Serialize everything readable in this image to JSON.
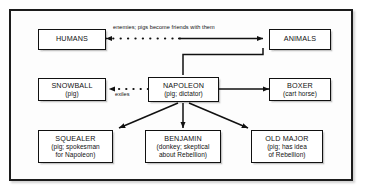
{
  "diagram": {
    "colors": {
      "frame": "#1c1c1c",
      "box_border": "#111111",
      "box_fill": "#ffffff",
      "line": "#111111",
      "text": "#111111",
      "page_background": "#ffffff"
    },
    "nodes": [
      {
        "id": "humans",
        "title": "HUMANS",
        "sub1": "",
        "sub2": ""
      },
      {
        "id": "animals",
        "title": "ANIMALS",
        "sub1": "",
        "sub2": ""
      },
      {
        "id": "snowball",
        "title": "SNOWBALL",
        "sub1": "(pig)",
        "sub2": ""
      },
      {
        "id": "napoleon",
        "title": "NAPOLEON",
        "sub1": "(pig; dictator)",
        "sub2": ""
      },
      {
        "id": "boxer",
        "title": "BOXER",
        "sub1": "(cart horse)",
        "sub2": ""
      },
      {
        "id": "squealer",
        "title": "SQUEALER",
        "sub1": "(pig; spokesman",
        "sub2": "for Napoleon)"
      },
      {
        "id": "benjamin",
        "title": "BENJAMIN",
        "sub1": "(donkey; skeptical",
        "sub2": "about Rebellion)"
      },
      {
        "id": "oldmajor",
        "title": "OLD MAJOR",
        "sub1": "(pig; has idea",
        "sub2": "of Rebellion)"
      }
    ],
    "edges": [
      {
        "id": "humans-animals",
        "label": "enemies; pigs become friends with them",
        "style": "dotted-to-solid",
        "from": "animals",
        "to": "humans"
      },
      {
        "id": "animals-napoleon",
        "label": "",
        "style": "solid-elbow",
        "from": "animals",
        "to": "napoleon"
      },
      {
        "id": "napoleon-snowball",
        "label": "exiles",
        "style": "dotted",
        "from": "napoleon",
        "to": "snowball"
      },
      {
        "id": "napoleon-boxer",
        "label": "",
        "style": "solid",
        "from": "napoleon",
        "to": "boxer"
      },
      {
        "id": "napoleon-squealer",
        "label": "",
        "style": "solid-diagonal",
        "from": "napoleon",
        "to": "squealer"
      },
      {
        "id": "napoleon-benjamin",
        "label": "",
        "style": "solid-vertical",
        "from": "napoleon",
        "to": "benjamin"
      },
      {
        "id": "napoleon-oldmajor",
        "label": "",
        "style": "solid-diagonal",
        "from": "napoleon",
        "to": "oldmajor"
      }
    ]
  }
}
